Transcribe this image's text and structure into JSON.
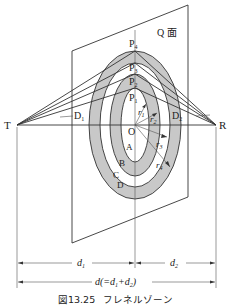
{
  "figure": {
    "caption_number": "図13.25",
    "caption_title": "フレネルゾーン",
    "plane_label": "Q 面",
    "points": {
      "transmitter": "T",
      "receiver": "R",
      "center": "O",
      "p1": "P",
      "p1_sub": "1",
      "p2": "P",
      "p2_sub": "2",
      "p3": "P",
      "p3_sub": "3",
      "p4": "P",
      "p4_sub": "4",
      "d1_point": "D",
      "d1_point_sub": "1",
      "d2_point": "D",
      "d2_point_sub": "2"
    },
    "zone_boundaries": [
      "A",
      "B",
      "C",
      "D"
    ],
    "radii": [
      {
        "base": "r",
        "sub": "1"
      },
      {
        "base": "r",
        "sub": "2"
      },
      {
        "base": "r",
        "sub": "3"
      },
      {
        "base": "r",
        "sub": "4"
      }
    ],
    "dimensions": {
      "d1": "d",
      "d1_sub": "1",
      "d2": "d",
      "d2_sub": "2",
      "total": "d(=d",
      "total_sub1": "1",
      "total_mid": "+d",
      "total_sub2": "2",
      "total_end": ")"
    },
    "colors": {
      "zone_fill": "#c8c8c8",
      "line": "#333333",
      "background": "#ffffff"
    }
  }
}
